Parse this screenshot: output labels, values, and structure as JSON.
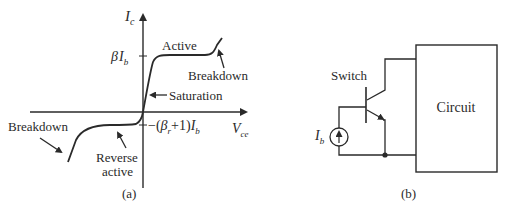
{
  "figure_a": {
    "caption": "(a)",
    "y_axis_label_main": "I",
    "y_axis_label_sub": "c",
    "x_axis_label_main": "V",
    "x_axis_label_sub": "ce",
    "tick_upper": {
      "beta": "β",
      "I": "I",
      "sub": "b"
    },
    "tick_lower": {
      "prefix": "−(",
      "beta": "β",
      "beta_sub": "r",
      "middle": "+1)",
      "I": "I",
      "sub": "b"
    },
    "labels": {
      "active": "Active",
      "breakdown_top": "Breakdown",
      "saturation": "Saturation",
      "breakdown_bottom": "Breakdown",
      "reverse_active_line1": "Reverse",
      "reverse_active_line2": "active"
    }
  },
  "figure_b": {
    "caption": "(b)",
    "switch_label": "Switch",
    "source_label_main": "I",
    "source_label_sub": "b",
    "circuit_label": "Circuit",
    "source_arrow": "↑"
  }
}
